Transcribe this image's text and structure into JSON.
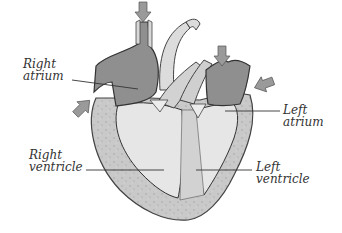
{
  "diagram": {
    "labels": {
      "right_atrium": {
        "line1": "Right",
        "line2": "atrium"
      },
      "left_atrium": {
        "line1": "Left",
        "line2": "atrium"
      },
      "right_ventricle": {
        "line1": "Right",
        "line2": "ventricle"
      },
      "left_ventricle": {
        "line1": "Left",
        "line2": "ventricle"
      }
    },
    "arrows": [
      {
        "name": "superior-vena-cava-inflow",
        "direction": "down"
      },
      {
        "name": "inferior-vena-cava-inflow",
        "direction": "up-right"
      },
      {
        "name": "pulmonary-vein-inflow-top",
        "direction": "down"
      },
      {
        "name": "pulmonary-vein-inflow-side",
        "direction": "left"
      }
    ],
    "colors": {
      "atrium_fill": "#8e8e8e",
      "ventricle_fill": "#e4e4e4",
      "wall_fill": "#c8c8c8",
      "vessel_fill": "#d6d6d6",
      "outline": "#444444",
      "arrow_fill": "#9a9a9a",
      "label_text": "#333333"
    }
  }
}
